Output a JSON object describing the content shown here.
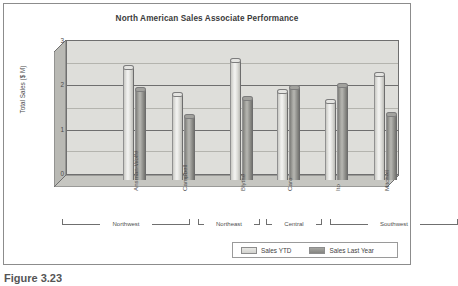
{
  "figure": {
    "caption": "Figure 3.23"
  },
  "chart_data": {
    "type": "bar",
    "title": "North American Sales Associate Performance",
    "xlabel": "",
    "ylabel": "Total Sales ($ M)",
    "categories": [
      "Ansman-Wolfe",
      "Campbell",
      "Blythe",
      "Caro",
      "Ito",
      "Mitchell"
    ],
    "series": [
      {
        "name": "Sales YTD",
        "values": [
          2.5,
          1.9,
          2.65,
          1.97,
          1.75,
          2.35
        ]
      },
      {
        "name": "Sales Last Year",
        "values": [
          2.0,
          1.4,
          1.8,
          2.05,
          2.1,
          1.45
        ]
      }
    ],
    "ylim": [
      0,
      3
    ],
    "yticks": [
      "0",
      "1",
      "2",
      "3"
    ],
    "minor_gridlines": [
      0.5,
      1.5,
      2.5
    ],
    "grid": true,
    "legend_position": "bottom-right",
    "style": "3d-cylinder",
    "groups": [
      {
        "label": "Northwest",
        "members": [
          "Ansman-Wolfe",
          "Campbell"
        ]
      },
      {
        "label": "Northeast",
        "members": [
          "Blythe"
        ]
      },
      {
        "label": "Central",
        "members": [
          "Caro"
        ]
      },
      {
        "label": "Southwest",
        "members": [
          "Ito",
          "Mitchell"
        ]
      }
    ],
    "colors": {
      "series_ytd": "#e4e4e1",
      "series_last_year": "#a2a29e",
      "plot_background": "#dededa",
      "axis": "#6f6f6f",
      "gridline_minor": "#b4b4ae",
      "text": "#4a4a4a"
    }
  },
  "axis": {
    "y_tick_0": "0",
    "y_tick_1": "1",
    "y_tick_2": "2",
    "y_tick_3": "3"
  },
  "xlabels": {
    "c0": "Ansman-Wolfe",
    "c1": "Campbell",
    "c2": "Blythe",
    "c3": "Caro",
    "c4": "Ito",
    "c5": "Mitchell"
  },
  "groups": {
    "g0": "Northwest",
    "g1": "Northeast",
    "g2": "Central",
    "g3": "Southwest"
  },
  "legend": {
    "item0": "Sales YTD",
    "item1": "Sales Last Year"
  }
}
